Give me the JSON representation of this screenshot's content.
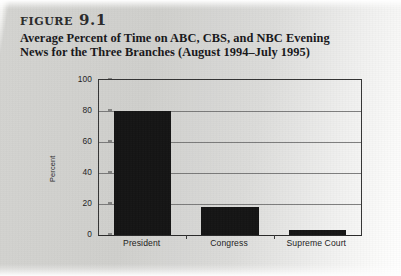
{
  "caption": {
    "figure_number": "figure 9.1",
    "title_line_1": "Average Percent of Time on ABC, CBS, and NBC Evening",
    "title_line_2": "News for the Three Branches (August 1994–July 1995)"
  },
  "colors": {
    "bar": "#141414",
    "axis": "#343434",
    "grid": "#6a6a6a",
    "page_background": "#cfcfcc",
    "text": "#17171a"
  },
  "chart_data": {
    "type": "bar",
    "title": "Average Percent of Time on ABC, CBS, and NBC Evening News for the Three Branches (August 1994–July 1995)",
    "categories": [
      "President",
      "Congress",
      "Supreme Court"
    ],
    "values": [
      80,
      18,
      3
    ],
    "xlabel": "",
    "ylabel": "Percent",
    "ylim": [
      0,
      100
    ],
    "yticks": [
      0,
      20,
      40,
      60,
      80,
      100
    ],
    "ytick_labels": [
      "0",
      "20",
      "40",
      "60",
      "80",
      "100"
    ],
    "grid": true,
    "grid_axis": "y",
    "legend": false
  }
}
